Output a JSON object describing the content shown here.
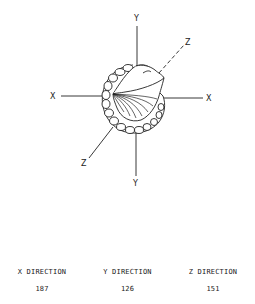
{
  "diagram": {
    "axes": {
      "x_left_label": "X",
      "x_right_label": "X",
      "y_top_label": "Y",
      "y_bottom_label": "Y",
      "z_upper_label": "Z",
      "z_lower_label": "Z"
    }
  },
  "table": {
    "headers": [
      "X DIRECTION",
      "Y DIRECTION",
      "Z DIRECTION"
    ],
    "values": [
      "187",
      "126",
      "151"
    ]
  }
}
